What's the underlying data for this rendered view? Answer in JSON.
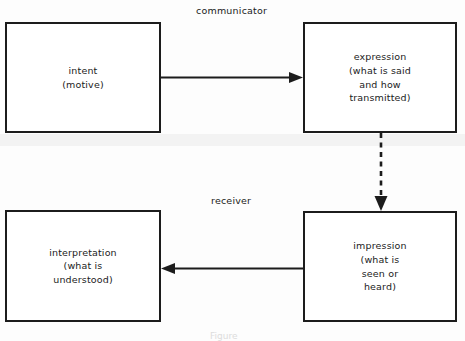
{
  "diagram": {
    "background_color": "#fdfdfd",
    "stroke_color": "#1c1c1c",
    "group_labels": [
      {
        "id": "communicator",
        "text": "communicator"
      },
      {
        "id": "receiver",
        "text": "receiver"
      }
    ],
    "nodes": [
      {
        "id": "intent",
        "text": "intent\n(motive)",
        "x": 5,
        "y": 22,
        "width": 156,
        "height": 111
      },
      {
        "id": "expression",
        "text": "expression\n(what is said\nand how\ntransmitted)",
        "x": 303,
        "y": 22,
        "width": 154,
        "height": 111
      },
      {
        "id": "interpretation",
        "text": "interpretation\n(what is\nunderstood)",
        "x": 5,
        "y": 210,
        "width": 156,
        "height": 112
      },
      {
        "id": "impression",
        "text": "impression\n(what is\nseen or\nheard)",
        "x": 303,
        "y": 211,
        "width": 154,
        "height": 111
      }
    ],
    "edges": [
      {
        "id": "intent-to-expression",
        "from": "intent",
        "to": "expression",
        "style": "solid",
        "direction": "right"
      },
      {
        "id": "expression-to-impression",
        "from": "expression",
        "to": "impression",
        "style": "dashed",
        "direction": "down"
      },
      {
        "id": "impression-to-interpretation",
        "from": "impression",
        "to": "interpretation",
        "style": "solid",
        "direction": "left"
      }
    ],
    "caption": "Figure"
  }
}
